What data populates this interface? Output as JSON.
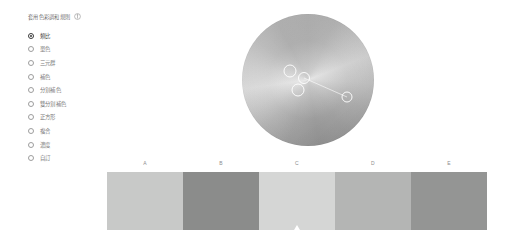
{
  "panel": {
    "header_label": "套用色彩調和規則",
    "info_icon": "info-icon",
    "rules": [
      {
        "label": "類比",
        "selected": true
      },
      {
        "label": "單色",
        "selected": false
      },
      {
        "label": "三元群",
        "selected": false
      },
      {
        "label": "補色",
        "selected": false
      },
      {
        "label": "分割補色",
        "selected": false
      },
      {
        "label": "雙分割補色",
        "selected": false
      },
      {
        "label": "正方形",
        "selected": false
      },
      {
        "label": "複合",
        "selected": false
      },
      {
        "label": "濃度",
        "selected": false
      },
      {
        "label": "自訂",
        "selected": false
      }
    ]
  },
  "wheel": {
    "name": "color-wheel",
    "markers": [
      {
        "id": "marker-a",
        "x": 48,
        "y": 57,
        "size": 13,
        "primary": false
      },
      {
        "id": "marker-b",
        "x": 62,
        "y": 64,
        "size": 12,
        "primary": false
      },
      {
        "id": "marker-c",
        "x": 56,
        "y": 76,
        "size": 13,
        "primary": true
      },
      {
        "id": "marker-d",
        "x": 105,
        "y": 83,
        "size": 11,
        "primary": false
      }
    ],
    "connector": {
      "x1": 62,
      "y1": 64,
      "x2": 105,
      "y2": 83
    }
  },
  "swatches": {
    "items": [
      {
        "label": "A",
        "color": "#c8c9c8",
        "selected": false
      },
      {
        "label": "B",
        "color": "#8b8c8b",
        "selected": false
      },
      {
        "label": "C",
        "color": "#d5d6d5",
        "selected": true
      },
      {
        "label": "D",
        "color": "#b4b5b4",
        "selected": false
      },
      {
        "label": "E",
        "color": "#949594",
        "selected": false
      }
    ],
    "marker_icon": "selection-triangle-icon"
  }
}
